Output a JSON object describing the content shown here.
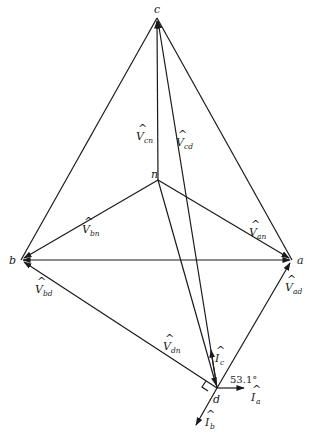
{
  "diagram": {
    "type": "phasor-diagram",
    "nodes": {
      "a": {
        "label": "a",
        "x": 292,
        "y": 260
      },
      "b": {
        "label": "b",
        "x": 21,
        "y": 260
      },
      "c": {
        "label": "c",
        "x": 157,
        "y": 18
      },
      "n": {
        "label": "n",
        "x": 158,
        "y": 180
      },
      "d": {
        "label": "d",
        "x": 217,
        "y": 388
      }
    },
    "phasors": [
      {
        "name": "V_cn",
        "base": "V",
        "sub": "cn",
        "from": "n",
        "to": "c"
      },
      {
        "name": "V_cd",
        "base": "V",
        "sub": "cd",
        "from": "d",
        "to": "c"
      },
      {
        "name": "V_bn",
        "base": "V",
        "sub": "bn",
        "from": "n",
        "to": "b"
      },
      {
        "name": "V_an",
        "base": "V",
        "sub": "an",
        "from": "n",
        "to": "a"
      },
      {
        "name": "V_bd",
        "base": "V",
        "sub": "bd",
        "from": "d",
        "to": "b"
      },
      {
        "name": "V_ad",
        "base": "V",
        "sub": "ad",
        "from": "d",
        "to": "a"
      },
      {
        "name": "V_dn",
        "base": "V",
        "sub": "dn",
        "from": "n",
        "to": "d"
      }
    ],
    "currents": [
      {
        "name": "I_a",
        "base": "I",
        "sub": "a"
      },
      {
        "name": "I_b",
        "base": "I",
        "sub": "b"
      },
      {
        "name": "I_c",
        "base": "I",
        "sub": "c"
      }
    ],
    "angle_label": "53.1°",
    "labels": {
      "a": "a",
      "b": "b",
      "c": "c",
      "n": "n",
      "d": "d",
      "V": "V",
      "I": "I",
      "cn": "cn",
      "cd": "cd",
      "bn": "bn",
      "an": "an",
      "bd": "bd",
      "ad": "ad",
      "dn": "dn",
      "ia": "a",
      "ib": "b",
      "ic": "c",
      "hat": "^"
    }
  }
}
